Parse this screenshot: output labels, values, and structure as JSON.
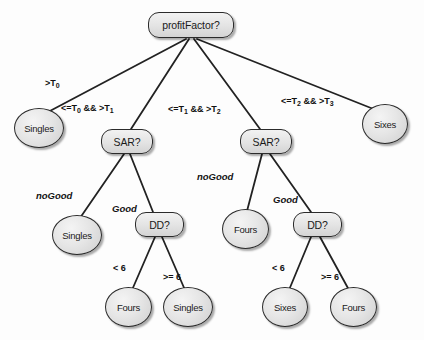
{
  "diagram": {
    "type": "decision-tree",
    "colors": {
      "node_fill": "#e6e6e6",
      "node_stroke": "#2b2b2b",
      "edge_stroke": "#222222",
      "background": "#fdfdfd",
      "text": "#1a1a1a"
    },
    "nodes": [
      {
        "id": "root",
        "label": "profitFactor?",
        "shape": "rounded-rect",
        "x": 148,
        "y": 12,
        "w": 86,
        "h": 26
      },
      {
        "id": "leafSingles1",
        "label": "Singles",
        "shape": "ellipse",
        "x": 14,
        "y": 108,
        "w": 50,
        "h": 40
      },
      {
        "id": "sarLeft",
        "label": "SAR?",
        "shape": "rounded-rect",
        "x": 101,
        "y": 129,
        "w": 52,
        "h": 25
      },
      {
        "id": "sarRight",
        "label": "SAR?",
        "shape": "rounded-rect",
        "x": 240,
        "y": 129,
        "w": 52,
        "h": 25
      },
      {
        "id": "leafSixes1",
        "label": "Sixes",
        "shape": "ellipse",
        "x": 362,
        "y": 104,
        "w": 46,
        "h": 40
      },
      {
        "id": "leafSingles2",
        "label": "Singles",
        "shape": "ellipse",
        "x": 52,
        "y": 215,
        "w": 50,
        "h": 40
      },
      {
        "id": "ddLeft",
        "label": "DD?",
        "shape": "rounded-rect",
        "x": 135,
        "y": 212,
        "w": 49,
        "h": 25
      },
      {
        "id": "leafFours1",
        "label": "Fours",
        "shape": "ellipse",
        "x": 222,
        "y": 209,
        "w": 47,
        "h": 40
      },
      {
        "id": "ddRight",
        "label": "DD?",
        "shape": "rounded-rect",
        "x": 293,
        "y": 212,
        "w": 49,
        "h": 25
      },
      {
        "id": "leafFours2",
        "label": "Fours",
        "shape": "ellipse",
        "x": 105,
        "y": 287,
        "w": 47,
        "h": 40
      },
      {
        "id": "leafSingles3",
        "label": "Singles",
        "shape": "ellipse",
        "x": 163,
        "y": 287,
        "w": 50,
        "h": 40
      },
      {
        "id": "leafSixes2",
        "label": "Sixes",
        "shape": "ellipse",
        "x": 262,
        "y": 287,
        "w": 46,
        "h": 40
      },
      {
        "id": "leafFours3",
        "label": "Fours",
        "shape": "ellipse",
        "x": 330,
        "y": 287,
        "w": 47,
        "h": 40
      }
    ],
    "edges": [
      {
        "from": "root",
        "to": "leafSingles1",
        "x1": 186,
        "y1": 39,
        "x2": 48,
        "y2": 112
      },
      {
        "from": "root",
        "to": "sarLeft",
        "x1": 189,
        "y1": 39,
        "x2": 131,
        "y2": 129
      },
      {
        "from": "root",
        "to": "sarRight",
        "x1": 194,
        "y1": 39,
        "x2": 260,
        "y2": 129
      },
      {
        "from": "root",
        "to": "leafSixes1",
        "x1": 197,
        "y1": 39,
        "x2": 376,
        "y2": 110
      },
      {
        "from": "sarLeft",
        "to": "leafSingles2",
        "x1": 124,
        "y1": 154,
        "x2": 80,
        "y2": 218
      },
      {
        "from": "sarLeft",
        "to": "ddLeft",
        "x1": 130,
        "y1": 154,
        "x2": 153,
        "y2": 212
      },
      {
        "from": "sarRight",
        "to": "leafFours1",
        "x1": 262,
        "y1": 154,
        "x2": 247,
        "y2": 211
      },
      {
        "from": "sarRight",
        "to": "ddRight",
        "x1": 270,
        "y1": 154,
        "x2": 311,
        "y2": 212
      },
      {
        "from": "ddLeft",
        "to": "leafFours2",
        "x1": 155,
        "y1": 237,
        "x2": 132,
        "y2": 290
      },
      {
        "from": "ddLeft",
        "to": "leafSingles3",
        "x1": 162,
        "y1": 237,
        "x2": 185,
        "y2": 290
      },
      {
        "from": "ddRight",
        "to": "leafSixes2",
        "x1": 311,
        "y1": 237,
        "x2": 289,
        "y2": 290
      },
      {
        "from": "ddRight",
        "to": "leafFours3",
        "x1": 320,
        "y1": 237,
        "x2": 349,
        "y2": 290
      }
    ],
    "edge_labels": [
      {
        "id": "lbl-gt-t0",
        "prefix": ">T",
        "sub1": "0",
        "mid": "",
        "suffix": "",
        "sub2": "",
        "style": "bold",
        "x": 45,
        "y": 78
      },
      {
        "id": "lbl-t0-t1",
        "prefix": "<=T",
        "sub1": "0",
        "mid": " && >T",
        "suffix": "",
        "sub2": "1",
        "style": "bold",
        "x": 61,
        "y": 103
      },
      {
        "id": "lbl-t1-t2",
        "prefix": "<=T",
        "sub1": "1",
        "mid": " && >T",
        "suffix": "",
        "sub2": "2",
        "style": "bold",
        "x": 168,
        "y": 104
      },
      {
        "id": "lbl-t2-t3",
        "prefix": "<=T",
        "sub1": "2",
        "mid": " && >T",
        "suffix": "",
        "sub2": "3",
        "style": "bold",
        "x": 281,
        "y": 96
      },
      {
        "id": "lbl-nogood-l",
        "prefix": "noGood",
        "sub1": "",
        "mid": "",
        "suffix": "",
        "sub2": "",
        "style": "italic",
        "x": 36,
        "y": 190
      },
      {
        "id": "lbl-good-l",
        "prefix": "Good",
        "sub1": "",
        "mid": "",
        "suffix": "",
        "sub2": "",
        "style": "italic",
        "x": 112,
        "y": 203
      },
      {
        "id": "lbl-nogood-r",
        "prefix": "noGood",
        "sub1": "",
        "mid": "",
        "suffix": "",
        "sub2": "",
        "style": "italic",
        "x": 197,
        "y": 171
      },
      {
        "id": "lbl-good-r",
        "prefix": "Good",
        "sub1": "",
        "mid": "",
        "suffix": "",
        "sub2": "",
        "style": "italic",
        "x": 273,
        "y": 194
      },
      {
        "id": "lbl-lt6-l",
        "prefix": "< 6",
        "sub1": "",
        "mid": "",
        "suffix": "",
        "sub2": "",
        "style": "bold",
        "x": 113,
        "y": 263
      },
      {
        "id": "lbl-ge6-l",
        "prefix": ">= 6",
        "sub1": "",
        "mid": "",
        "suffix": "",
        "sub2": "",
        "style": "bold",
        "x": 163,
        "y": 272
      },
      {
        "id": "lbl-lt6-r",
        "prefix": "< 6",
        "sub1": "",
        "mid": "",
        "suffix": "",
        "sub2": "",
        "style": "bold",
        "x": 272,
        "y": 263
      },
      {
        "id": "lbl-ge6-r",
        "prefix": ">= 6",
        "sub1": "",
        "mid": "",
        "suffix": "",
        "sub2": "",
        "style": "bold",
        "x": 321,
        "y": 272
      }
    ]
  }
}
